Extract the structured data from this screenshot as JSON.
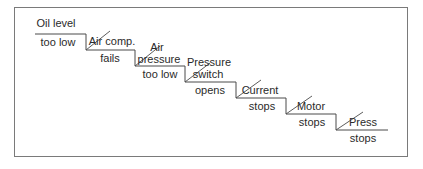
{
  "diagram": {
    "type": "fault-sequence-staircase",
    "steps": [
      {
        "id": "oil-level",
        "top": "Oil level",
        "bottom": "too low"
      },
      {
        "id": "air-comp",
        "top": "Air comp.",
        "bottom": "fails"
      },
      {
        "id": "air-pressure",
        "top_line1": "Air",
        "top_line2": "pressure",
        "bottom": "too low"
      },
      {
        "id": "pressure-switch",
        "top_line1": "Pressure",
        "top_line2": "switch",
        "bottom": "opens"
      },
      {
        "id": "current",
        "top": "Current",
        "bottom": "stops"
      },
      {
        "id": "motor",
        "top": "Motor",
        "bottom": "stops"
      },
      {
        "id": "press",
        "top": "Press",
        "bottom": "stops"
      }
    ],
    "colors": {
      "line": "#4a4a4a",
      "text": "#2a2a2a",
      "frame": "#7a7a7a",
      "background": "#ffffff"
    }
  }
}
